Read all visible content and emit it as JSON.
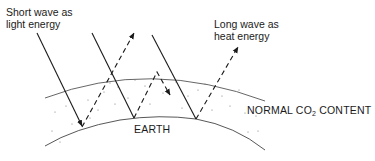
{
  "diagram": {
    "type": "greenhouse-effect-schematic",
    "labels": {
      "short_wave_line1": "Short wave as",
      "short_wave_line2": "light energy",
      "long_wave_line1": "Long wave as",
      "long_wave_line2": "heat energy",
      "earth": "EARTH",
      "atmosphere_prefix": "NORMAL CO",
      "atmosphere_subscript": "2",
      "atmosphere_suffix": " CONTENT"
    },
    "legend": {
      "solid_line": "Incoming short wave radiation (light energy)",
      "dashed_line": "Outgoing long wave radiation (heat energy)"
    },
    "colors": {
      "line": "#1a1a1a",
      "arc": "#555555",
      "dots": "#777777",
      "background": "#ffffff"
    }
  }
}
